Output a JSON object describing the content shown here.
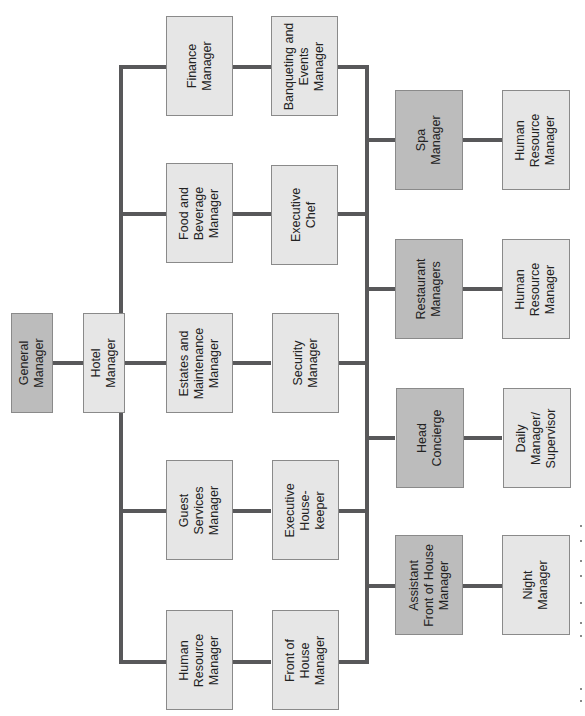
{
  "diagram": {
    "type": "organizational-chart",
    "orientation": "rotated-90-ccw",
    "colors": {
      "line": "#58585a",
      "box_light": "#e6e6e6",
      "box_dark": "#bcbcbc",
      "border": "#8a8a8a",
      "text": "#222222"
    },
    "root": {
      "general_manager": "General\nManager",
      "hotel_manager": "Hotel\nManager"
    },
    "left_branch": {
      "rows": [
        {
          "manager": "Finance\nManager",
          "report": "Banqueting and\nEvents\nManager"
        },
        {
          "manager": "Food and\nBeverage\nManager",
          "report": "Executive\nChef"
        },
        {
          "manager": "Estates and\nMaintenance\nManager",
          "report": "Security\nManager"
        },
        {
          "manager": "Guest\nServices\nManager",
          "report": "Executive\nHouse-\nkeeper"
        },
        {
          "manager": "Human\nResource\nManager",
          "report": "Front of\nHouse\nManager"
        }
      ]
    },
    "right_branch": {
      "rows": [
        {
          "manager": "Spa\nManager",
          "report": "Human\nResource\nManager"
        },
        {
          "manager": "Restaurant\nManagers",
          "report": "Human\nResource\nManager"
        },
        {
          "manager": "Head\nConcierge",
          "report": "Daily\nManager/\nSupervisor"
        },
        {
          "manager": "Assistant\nFront of House\nManager",
          "report": "Night\nManager"
        }
      ]
    }
  }
}
